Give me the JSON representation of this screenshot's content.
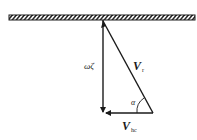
{
  "diagram": {
    "type": "velocity-triangle",
    "ground": {
      "label": "fixed surface (hatched)"
    },
    "labels": {
      "vertical_prefix": "ω",
      "vertical_symbol": "ζ",
      "hypotenuse_main": "V",
      "hypotenuse_sub": "r",
      "horizontal_main": "V",
      "horizontal_sub": "hc",
      "angle": "α"
    },
    "colors": {
      "stroke": "#1a1a1a",
      "background": "#ffffff"
    }
  }
}
